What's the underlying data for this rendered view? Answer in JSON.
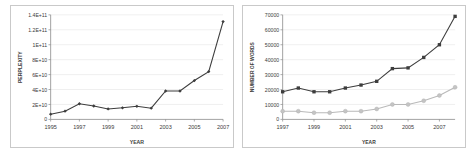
{
  "figure": {
    "panel_count": 2
  },
  "chart_data": [
    {
      "type": "line",
      "title": "",
      "xlabel": "YEAR",
      "ylabel": "PERPLEXITY",
      "grid": true,
      "legend_position": "none",
      "xlim": [
        1995,
        2007
      ],
      "ylim": [
        0,
        140000000000
      ],
      "xticks": [
        1995,
        1997,
        1999,
        2001,
        2003,
        2005,
        2007
      ],
      "xtick_labels": [
        "1995",
        "1997",
        "1999",
        "2001",
        "2003",
        "2005",
        "2007"
      ],
      "yticks": [
        0,
        20000000000,
        40000000000,
        60000000000,
        80000000000,
        100000000000,
        120000000000,
        140000000000
      ],
      "ytick_labels": [
        "0",
        "2E+10",
        "4E+10",
        "6E+10",
        "8E+10",
        "1E+11",
        "1.2E+11",
        "1.4E+11"
      ],
      "x": [
        1995,
        1996,
        1997,
        1998,
        1999,
        2000,
        2001,
        2002,
        2003,
        2004,
        2005,
        2006,
        2007
      ],
      "series": [
        {
          "name": "perplexity",
          "color": "#3d3d3d",
          "marker": "diamond",
          "values": [
            7000000000,
            11000000000,
            21000000000,
            18000000000,
            14000000000,
            15500000000,
            17500000000,
            15000000000,
            38000000000,
            38000000000,
            52000000000,
            64000000000,
            131000000000
          ]
        }
      ]
    },
    {
      "type": "line",
      "title": "",
      "xlabel": "YEAR",
      "ylabel": "NUMBER OF WORDS",
      "grid": true,
      "legend_position": "none",
      "xlim": [
        1997,
        2008
      ],
      "ylim": [
        0,
        70000
      ],
      "xticks": [
        1997,
        1999,
        2001,
        2003,
        2005,
        2007
      ],
      "xtick_labels": [
        "1997",
        "1999",
        "2001",
        "2003",
        "2005",
        "2007"
      ],
      "yticks": [
        0,
        10000,
        20000,
        30000,
        40000,
        50000,
        60000,
        70000
      ],
      "ytick_labels": [
        "0",
        "10000",
        "20000",
        "30000",
        "40000",
        "50000",
        "60000",
        "70000"
      ],
      "x": [
        1997,
        1998,
        1999,
        2000,
        2001,
        2002,
        2003,
        2004,
        2005,
        2006,
        2007,
        2008
      ],
      "series": [
        {
          "name": "upper-series",
          "color": "#3d3d3d",
          "marker": "square",
          "values": [
            18500,
            21000,
            18500,
            18500,
            21000,
            23000,
            25500,
            34000,
            34500,
            41500,
            50000,
            69000
          ]
        },
        {
          "name": "lower-series",
          "color": "#c4c4c4",
          "marker": "circle",
          "values": [
            5500,
            5500,
            4500,
            4500,
            5500,
            5500,
            7000,
            10000,
            10000,
            12500,
            16000,
            21500
          ]
        }
      ]
    }
  ]
}
